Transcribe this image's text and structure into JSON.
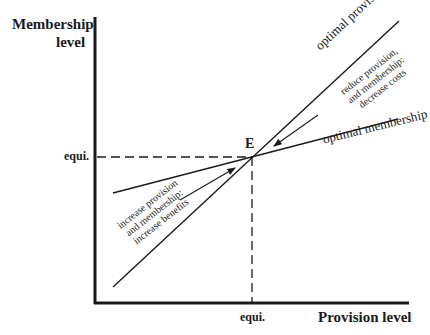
{
  "axes": {
    "y_label_line1": "Membership",
    "y_label_line2": "level",
    "x_label": "Provision level",
    "y_tick": "equi.",
    "x_tick": "equi."
  },
  "point": {
    "label": "E"
  },
  "lines": {
    "provision_label": "optimal provision",
    "membership_label": "optimal membership"
  },
  "annotations": {
    "upper": [
      "reduce provision,",
      "and membership:",
      "decrease costs"
    ],
    "lower": [
      "increase provision",
      "and membership:",
      "increase benefits"
    ]
  },
  "colors": {
    "ink": "#1a1a1a",
    "background": "#ffffff"
  }
}
